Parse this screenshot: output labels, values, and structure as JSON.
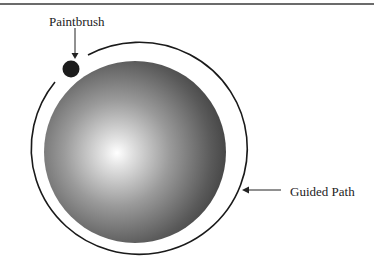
{
  "figure": {
    "labels": {
      "paintbrush": "Paintbrush",
      "guided_path": "Guided Path"
    },
    "elements": {
      "sphere": {
        "cx": 135,
        "cy": 152,
        "r": 91,
        "highlight_cx": 117,
        "highlight_cy": 153,
        "colors": [
          "#ffffff",
          "#a8a8a8",
          "#5e5e5e",
          "#3a3a3a"
        ]
      },
      "guided_path_ring": {
        "cx": 136,
        "cy": 152,
        "rx": 108,
        "ry": 106,
        "stroke": "#1a1a1a",
        "gap_description": "open near the paintbrush at upper-left"
      },
      "paintbrush_dot": {
        "cx": 71,
        "cy": 69,
        "r": 8,
        "fill": "#1c1c1c"
      }
    }
  }
}
